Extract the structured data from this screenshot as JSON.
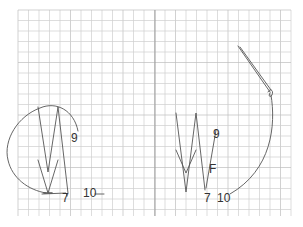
{
  "diagram": {
    "background": "#ffffff",
    "grid": {
      "x0": 18,
      "y0": 10,
      "x1": 291,
      "y1": 216,
      "cell": 10.5,
      "minor_color": "#cfcfcf",
      "major_color": "#bdbdbd",
      "divider_x": 155
    },
    "stroke_color": "#555555",
    "panels": [
      {
        "name": "left-panel",
        "labels": [
          {
            "text": "9",
            "x": 71,
            "y": 142
          },
          {
            "text": "7",
            "x": 62,
            "y": 202
          },
          {
            "text": "10",
            "x": 83,
            "y": 197
          }
        ]
      },
      {
        "name": "right-panel",
        "labels": [
          {
            "text": "9",
            "x": 213,
            "y": 138
          },
          {
            "text": "F",
            "x": 209,
            "y": 173
          },
          {
            "text": "7",
            "x": 204,
            "y": 202
          },
          {
            "text": "10",
            "x": 217,
            "y": 202
          }
        ]
      }
    ]
  }
}
